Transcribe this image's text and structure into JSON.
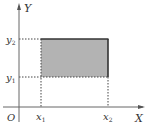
{
  "diagram": {
    "type": "coordinate-region",
    "axes": {
      "x_label": "X",
      "y_label": "Y",
      "origin_label": "O"
    },
    "ticks": {
      "x1": {
        "base": "x",
        "sub": "1"
      },
      "x2": {
        "base": "x",
        "sub": "2"
      },
      "y1": {
        "base": "y",
        "sub": "1"
      },
      "y2": {
        "base": "y",
        "sub": "2"
      }
    },
    "region": {
      "description": "Shaded rectangle x1<=X<=x2, y1<=Y<=y2",
      "fill": "#b3b3b3",
      "solid_edges": [
        "top",
        "right"
      ],
      "dotted_edges": [
        "left",
        "bottom"
      ]
    },
    "colors": {
      "axis": "#666666",
      "edge": "#333333",
      "dotted": "#444444"
    }
  }
}
